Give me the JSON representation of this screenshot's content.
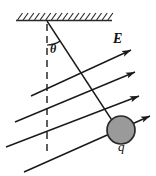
{
  "figure": {
    "labels": {
      "field": "E",
      "charge": "q",
      "angle": "θ"
    },
    "colors": {
      "ink": "#1a1a1a",
      "sphere_fill": "#9a9a9a",
      "sphere_stroke": "#2a2a2a",
      "background": "#ffffff",
      "hatch": "#2a2a2a"
    },
    "ceiling": {
      "name": "hatched-ceiling",
      "x_start": 16,
      "x_end": 112,
      "y": 20,
      "hatch_count": 17,
      "hatch_height": 7,
      "hatch_slant": 5
    },
    "pivot": {
      "x": 47,
      "y": 21
    },
    "string": {
      "from_x": 47,
      "from_y": 21,
      "to_x": 117,
      "to_y": 128,
      "length_label": ""
    },
    "vertical_dashed": {
      "x": 47,
      "y_top": 24,
      "y_bottom": 152,
      "dash": "7 5"
    },
    "angle_arc": {
      "radius": 24,
      "start_deg": 90,
      "sweep_deg": 33
    },
    "sphere": {
      "cx": 121,
      "cy": 130,
      "r": 14
    },
    "field_lines": [
      {
        "x1": 31,
        "y1": 96,
        "x2": 131,
        "y2": 50,
        "arrow": true
      },
      {
        "x1": 15,
        "y1": 122,
        "x2": 135,
        "y2": 72,
        "arrow": true
      },
      {
        "x1": 6,
        "y1": 147,
        "x2": 139,
        "y2": 96,
        "arrow": true
      },
      {
        "x1": 24,
        "y1": 172,
        "x2": 150,
        "y2": 116,
        "arrow": true
      }
    ],
    "arrow_size": {
      "length": 9,
      "width": 4.2
    }
  }
}
